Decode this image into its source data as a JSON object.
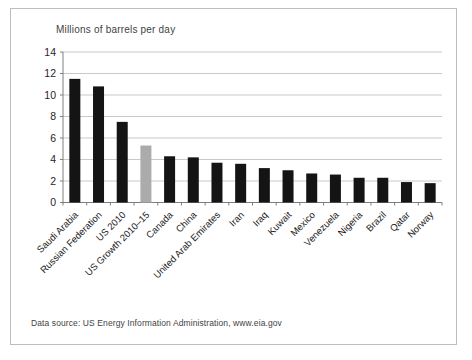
{
  "figure": {
    "source_note": "Data source: US Energy Information Administration, www.eia.gov"
  },
  "chart_data": {
    "type": "bar",
    "title": "Millions of barrels per day",
    "categories": [
      "Saudi Arabia",
      "Russian Federation",
      "US 2010",
      "US Growth 2010–15",
      "Canada",
      "China",
      "United Arab Emirates",
      "Iran",
      "Iraq",
      "Kuwait",
      "Mexico",
      "Venezuela",
      "Nigeria",
      "Brazil",
      "Qatar",
      "Norway"
    ],
    "values": [
      11.5,
      10.8,
      7.5,
      5.3,
      4.3,
      4.2,
      3.7,
      3.6,
      3.2,
      3.0,
      2.7,
      2.6,
      2.3,
      2.3,
      1.9,
      1.8
    ],
    "highlight_index": 3,
    "bar_color": "#141414",
    "highlight_color": "#ababab",
    "grid_color": "#c9c9c9",
    "axis_color": "#7f7f7f",
    "ylim": [
      0,
      14
    ],
    "ytick_step": 2,
    "grid": true,
    "legend": "none",
    "xlabel": "",
    "ylabel": "",
    "x_label_rotation": -45
  }
}
